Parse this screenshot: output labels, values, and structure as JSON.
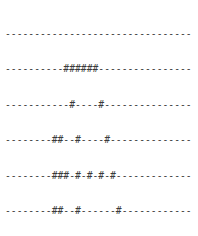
{
  "art": {
    "columns": 32,
    "rows": [
      "--------------------------------",
      "----------######----------------",
      "-----------#----#---------------",
      "--------##--#----#--------------",
      "--------###-#-#-#-#-------------",
      "--------##--#------#------------",
      "--------##--#-###-#-------------",
      "--------#####-----####----------",
      "----------###-----######--------",
      "------------#-----#--###--------",
      "------------#-----#--###--------",
      "------------#--#--#-####--------",
      "------------#--#--#--###--------",
      "------------#--#--#-------------",
      "-----------#---#---#------------",
      "----------#----#----#-----------",
      "----------#####-#####-----------",
      "--------------------------------",
      "--------------------------------"
    ]
  },
  "colors": {
    "text": "#3a3a3a",
    "background": "#ffffff"
  }
}
